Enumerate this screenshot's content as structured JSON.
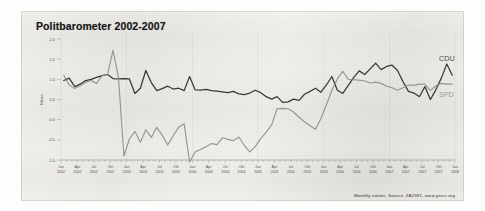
{
  "title": "Politbarometer 2002-2007",
  "footer": "Monthly values. Source: ZA2391, www.gesis.org",
  "legend": {
    "cdu": "CDU",
    "spd": "SPD"
  },
  "colors": {
    "cdu": "#2f2e2c",
    "spd": "#8d8c88",
    "axis": "#8a8884",
    "text": "#3b3a38",
    "paper": "#f0efec"
  },
  "axes": {
    "ylabel": "Mean",
    "yticks": [
      "2.0",
      "1.5",
      "1.0",
      "0.5",
      "0.0",
      "-0.5",
      "-1.0"
    ],
    "xticks": [
      {
        "m": "Jan",
        "y": "2002"
      },
      {
        "m": "Apr",
        "y": "2002"
      },
      {
        "m": "Jul",
        "y": "2002"
      },
      {
        "m": "Okt",
        "y": "2002"
      },
      {
        "m": "Jan",
        "y": "2003"
      },
      {
        "m": "Apr",
        "y": "2003"
      },
      {
        "m": "Jul",
        "y": "2003"
      },
      {
        "m": "Okt",
        "y": "2003"
      },
      {
        "m": "Jan",
        "y": "2004"
      },
      {
        "m": "Apr",
        "y": "2004"
      },
      {
        "m": "Jul",
        "y": "2004"
      },
      {
        "m": "Okt",
        "y": "2004"
      },
      {
        "m": "Jan",
        "y": "2005"
      },
      {
        "m": "Apr",
        "y": "2005"
      },
      {
        "m": "Jul",
        "y": "2005"
      },
      {
        "m": "Okt",
        "y": "2005"
      },
      {
        "m": "Jan",
        "y": "2006"
      },
      {
        "m": "Apr",
        "y": "2006"
      },
      {
        "m": "Jul",
        "y": "2006"
      },
      {
        "m": "Okt",
        "y": "2006"
      },
      {
        "m": "Jan",
        "y": "2007"
      },
      {
        "m": "Apr",
        "y": "2007"
      },
      {
        "m": "Jul",
        "y": "2007"
      },
      {
        "m": "Okt",
        "y": "2007"
      },
      {
        "m": "Jan",
        "y": "2008"
      }
    ]
  },
  "chart_data": {
    "type": "line",
    "title": "Politbarometer 2002-2007",
    "xlabel": "",
    "ylabel": "Mean",
    "ylim": [
      -1.0,
      2.0
    ],
    "grid": false,
    "legend_position": "right-inline",
    "x": [
      "2002-01",
      "2002-02",
      "2002-03",
      "2002-04",
      "2002-05",
      "2002-06",
      "2002-07",
      "2002-08",
      "2002-09",
      "2002-10",
      "2002-11",
      "2002-12",
      "2003-01",
      "2003-02",
      "2003-03",
      "2003-04",
      "2003-05",
      "2003-06",
      "2003-07",
      "2003-08",
      "2003-09",
      "2003-10",
      "2003-11",
      "2003-12",
      "2004-01",
      "2004-02",
      "2004-03",
      "2004-04",
      "2004-05",
      "2004-06",
      "2004-07",
      "2004-08",
      "2004-09",
      "2004-10",
      "2004-11",
      "2004-12",
      "2005-01",
      "2005-02",
      "2005-03",
      "2005-04",
      "2005-05",
      "2005-06",
      "2005-07",
      "2005-08",
      "2005-09",
      "2005-10",
      "2005-11",
      "2005-12",
      "2006-01",
      "2006-02",
      "2006-03",
      "2006-04",
      "2006-05",
      "2006-06",
      "2006-07",
      "2006-08",
      "2006-09",
      "2006-10",
      "2006-11",
      "2006-12",
      "2007-01",
      "2007-02",
      "2007-03",
      "2007-04",
      "2007-05",
      "2007-06",
      "2007-07",
      "2007-08",
      "2007-09",
      "2007-10",
      "2007-11",
      "2007-12"
    ],
    "series": [
      {
        "name": "CDU",
        "color": "#2f2e2c",
        "values": [
          0.97,
          1.03,
          0.82,
          0.88,
          0.97,
          1.0,
          1.05,
          1.09,
          1.12,
          1.02,
          1.01,
          1.02,
          1.01,
          0.65,
          0.78,
          1.22,
          0.92,
          0.72,
          0.77,
          0.83,
          0.76,
          0.78,
          0.72,
          1.07,
          0.74,
          0.73,
          0.75,
          0.72,
          0.71,
          0.69,
          0.67,
          0.7,
          0.64,
          0.62,
          0.66,
          0.73,
          0.67,
          0.57,
          0.51,
          0.57,
          0.43,
          0.44,
          0.51,
          0.48,
          0.63,
          0.7,
          0.78,
          0.68,
          0.86,
          1.07,
          0.73,
          0.65,
          0.85,
          1.05,
          1.21,
          1.12,
          1.26,
          1.4,
          1.24,
          1.32,
          1.35,
          1.22,
          0.94,
          0.7,
          0.66,
          0.57,
          0.82,
          0.5,
          0.74,
          1.03,
          1.38,
          1.1
        ]
      },
      {
        "name": "SPD",
        "color": "#8d8c88",
        "values": [
          1.1,
          0.86,
          0.77,
          0.84,
          0.93,
          0.97,
          0.9,
          1.09,
          1.12,
          1.72,
          1.05,
          -0.9,
          -0.48,
          -0.29,
          -0.56,
          -0.25,
          -0.44,
          -0.19,
          -0.39,
          -0.63,
          -0.4,
          -0.19,
          -0.1,
          -1.05,
          -0.8,
          -0.74,
          -0.67,
          -0.59,
          -0.62,
          -0.45,
          -0.49,
          -0.52,
          -0.43,
          -0.64,
          -0.8,
          -0.67,
          -0.47,
          -0.31,
          -0.13,
          0.27,
          0.28,
          0.27,
          0.19,
          0.06,
          -0.05,
          -0.15,
          -0.24,
          0.03,
          0.37,
          0.73,
          1.01,
          1.2,
          1.0,
          0.99,
          0.98,
          0.96,
          0.91,
          0.93,
          0.9,
          0.83,
          0.79,
          0.73,
          0.79,
          0.86,
          0.85,
          0.88,
          0.88,
          0.72,
          0.84,
          0.9,
          0.88,
          0.88
        ]
      }
    ]
  }
}
